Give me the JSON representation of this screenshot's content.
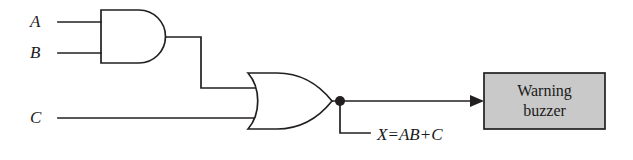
{
  "diagram": {
    "type": "logic-circuit-schematic",
    "background_color": "#ffffff",
    "line_color": "#231f20",
    "inputs": [
      {
        "id": "a",
        "label": "A"
      },
      {
        "id": "b",
        "label": "B"
      },
      {
        "id": "c",
        "label": "C"
      }
    ],
    "gates": [
      {
        "id": "and-gate",
        "type": "AND",
        "inputs": [
          "A",
          "B"
        ],
        "output_expression": "AB"
      },
      {
        "id": "or-gate",
        "type": "OR",
        "inputs": [
          "AB",
          "C"
        ],
        "output_expression": "AB + C"
      }
    ],
    "output": {
      "name": "X",
      "equation_variable": "X",
      "equation_operator": "=",
      "equation_term_1": "AB",
      "equation_plus": "+",
      "equation_term_2": "C",
      "equation_full": "X = AB + C"
    },
    "load": {
      "id": "warning-buzzer",
      "line_1": "Warning",
      "line_2": "buzzer",
      "fill_color": "#c9c9c9",
      "border_color": "#231f20"
    }
  }
}
